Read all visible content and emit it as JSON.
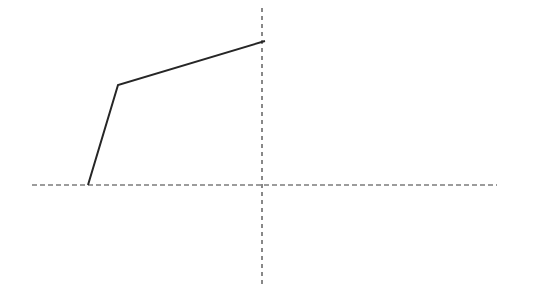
{
  "figure": {
    "name": "piecewise-line-diagram",
    "background_color": "#ffffff",
    "width": 541,
    "height": 288,
    "title": "",
    "subtitle": ""
  },
  "axes": {
    "x_axis": {
      "label": "",
      "style": "dashed",
      "color": "#3a3a3a",
      "stroke_width": 1.2,
      "dash_pattern": "5,3",
      "y_position": 185,
      "x_start": 32,
      "x_end": 497,
      "tick_labels": []
    },
    "y_axis": {
      "label": "",
      "style": "dashed",
      "color": "#3a3a3a",
      "stroke_width": 1.2,
      "dash_pattern": "4,4",
      "x_position": 262,
      "y_start": 8,
      "y_end": 285,
      "tick_labels": []
    },
    "origin": {
      "x": 262,
      "y": 185
    }
  },
  "chart_data": {
    "type": "line",
    "title": "",
    "xlabel": "",
    "ylabel": "",
    "grid": false,
    "legend": [],
    "legend_position": "none",
    "xlim": [
      -7.67,
      7.75
    ],
    "ylim": [
      -1.66,
      2.95
    ],
    "axis_note": "Axes drawn as dashed crosshair lines through origin; no tick marks or numeric labels are rendered.",
    "series": [
      {
        "name": "polyline",
        "color": "#262626",
        "stroke_width": 2,
        "style": "solid",
        "marker": "none",
        "pixel_points": [
          {
            "x": 88,
            "y": 185
          },
          {
            "x": 118,
            "y": 85
          },
          {
            "x": 265,
            "y": 41
          }
        ],
        "x": [
          -2.9,
          -2.4,
          0.05
        ],
        "values": [
          0,
          1.67,
          2.4
        ],
        "annotations": []
      }
    ]
  }
}
